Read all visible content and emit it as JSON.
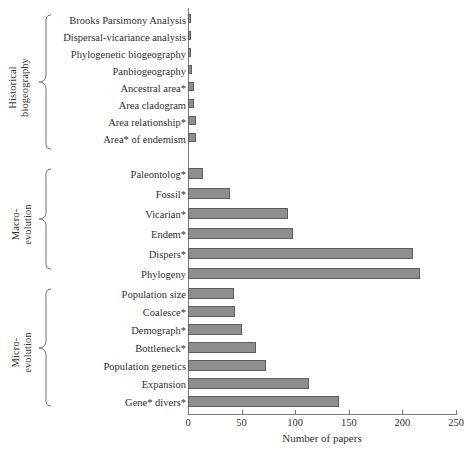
{
  "chart_data": {
    "type": "bar",
    "orientation": "horizontal",
    "title": "",
    "xlabel": "Number of papers",
    "ylabel": "",
    "xlim": [
      0,
      250
    ],
    "xticks": [
      0,
      50,
      100,
      150,
      200,
      250
    ],
    "grid": false,
    "legend": null,
    "bar_color": "#8e8e8e",
    "bar_edge_color": "#5e5e5e",
    "groups": [
      {
        "name": "Historical biogeography",
        "label_lines": "Historical\nbiogeography",
        "categories": [
          "Brooks Parsimony Analysis",
          "Dispersal-vicariance analysis",
          "Phylogenetic biogeography",
          "Panbiogeography",
          "Ancestral area*",
          "Area cladogram",
          "Area relationship*",
          "Area* of endemism"
        ],
        "values": [
          3,
          3,
          3,
          4,
          6,
          6,
          7,
          7
        ]
      },
      {
        "name": "Macro-evolution",
        "label_lines": "Macro-\nevolution",
        "categories": [
          "Paleontolog*",
          "Fossil*",
          "Vicarian*",
          "Endem*",
          "Dispers*",
          "Phylogeny"
        ],
        "values": [
          14,
          39,
          93,
          98,
          210,
          216
        ]
      },
      {
        "name": "Micro-evolution",
        "label_lines": "Micro-\nevolution",
        "categories": [
          "Population size",
          "Coalesce*",
          "Demograph*",
          "Bottleneck*",
          "Population genetics",
          "Expansion",
          "Gene* divers*"
        ],
        "values": [
          43,
          44,
          50,
          63,
          73,
          113,
          141
        ]
      }
    ]
  },
  "axis": {
    "xlabel": "Number of papers",
    "ticklabels": [
      "0",
      "50",
      "100",
      "150",
      "200",
      "250"
    ]
  }
}
